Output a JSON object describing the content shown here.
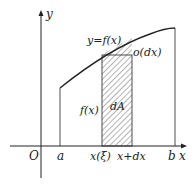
{
  "diagram": {
    "axes": {
      "x_label": "x",
      "y_label": "y",
      "origin_label": "O"
    },
    "curve_label": "y=f(x)",
    "bounds": {
      "a": "a",
      "b": "b"
    },
    "strip": {
      "left_label": "x(ξ)",
      "right_label": "x+dx",
      "height_label": "f(x)",
      "area_label": "dA",
      "error_label": "o(dx)"
    },
    "colors": {
      "stroke": "#222222",
      "hatch": "#444444"
    }
  }
}
